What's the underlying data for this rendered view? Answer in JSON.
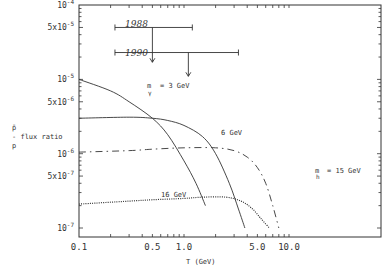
{
  "chart_data": {
    "type": "line",
    "title": "",
    "xlabel": "T (GeV)",
    "ylabel": "p̄ / p flux ratio",
    "xscale": "log",
    "yscale": "log",
    "xlim": [
      0.1,
      17
    ],
    "ylim": [
      1e-07,
      0.0001
    ],
    "grid": false,
    "x_ticks": [
      {
        "value": 0.1,
        "label": "0.1"
      },
      {
        "value": 0.5,
        "label": "0.5"
      },
      {
        "value": 1.0,
        "label": "1.0"
      },
      {
        "value": 5.0,
        "label": "5.0"
      },
      {
        "value": 10.0,
        "label": "10.0"
      }
    ],
    "y_ticks": [
      {
        "value": 0.0001,
        "base": "10",
        "exp": "-4"
      },
      {
        "value": 5e-05,
        "base": "5x10",
        "exp": "-5"
      },
      {
        "value": 1e-05,
        "base": "10",
        "exp": "-5"
      },
      {
        "value": 5e-06,
        "base": "5x10",
        "exp": "-6"
      },
      {
        "value": 1e-06,
        "base": "10",
        "exp": "-6"
      },
      {
        "value": 5e-07,
        "base": "5x10",
        "exp": "-7"
      },
      {
        "value": 1e-07,
        "base": "10",
        "exp": "-7"
      }
    ],
    "series": [
      {
        "name": "m_gamma~ = 3 GeV",
        "style": "solid",
        "x": [
          0.1,
          0.2,
          0.3,
          0.5,
          0.7,
          1.0,
          1.3,
          1.6
        ],
        "y": [
          1e-05,
          7e-06,
          5e-06,
          3e-06,
          1.8e-06,
          8e-07,
          4e-07,
          2e-07
        ]
      },
      {
        "name": "6 GeV",
        "style": "solid",
        "x": [
          0.1,
          0.3,
          0.5,
          0.7,
          1.0,
          1.5,
          2.0,
          2.7,
          3.3,
          3.8
        ],
        "y": [
          3e-06,
          3.1e-06,
          3e-06,
          2.8e-06,
          2.4e-06,
          1.7e-06,
          1e-06,
          4e-07,
          1.8e-07,
          1e-07
        ]
      },
      {
        "name": "m_h~ = 15 GeV",
        "style": "dash-dot",
        "x": [
          0.1,
          0.3,
          0.5,
          1.0,
          2.0,
          3.0,
          4.0,
          5.0,
          6.0,
          7.0,
          8.0
        ],
        "y": [
          1.05e-06,
          1.1e-06,
          1.15e-06,
          1.2e-06,
          1.2e-06,
          1.1e-06,
          9e-07,
          6.5e-07,
          4e-07,
          2e-07,
          1e-07
        ]
      },
      {
        "name": "16 GeV",
        "style": "dotted",
        "x": [
          0.1,
          0.3,
          0.5,
          1.0,
          1.5,
          2.5,
          3.5,
          4.5,
          5.5,
          6.5
        ],
        "y": [
          2.1e-07,
          2.3e-07,
          2.4e-07,
          2.5e-07,
          2.6e-07,
          2.6e-07,
          2.3e-07,
          1.8e-07,
          1.3e-07,
          1e-07
        ]
      }
    ],
    "annotations": [
      {
        "text": "1988",
        "type": "measurement-upper-limit",
        "x_range": [
          0.22,
          1.2
        ],
        "y": 5e-05,
        "arrow_x": 0.5,
        "arrow_to_y": 1.7e-05
      },
      {
        "text": "1990",
        "type": "measurement-upper-limit",
        "x_range": [
          0.22,
          3.3
        ],
        "y": 2.3e-05,
        "arrow_x": 1.1,
        "arrow_to_y": 1.1e-05
      },
      {
        "text": "m~ = 3 GeV",
        "subscript": "γ",
        "near_series": 0
      },
      {
        "text": "6 GeV",
        "near_series": 1
      },
      {
        "text": "m~ = 15 GeV",
        "subscript": "h",
        "near_series": 2
      },
      {
        "text": "16 GeV",
        "near_series": 3
      }
    ]
  },
  "labels": {
    "ylabel_top": "p̄",
    "ylabel_mid": "- flux ratio",
    "ylabel_bottom": "p",
    "xlabel": "T (GeV)",
    "ann_1988": "1988",
    "ann_1990": "1990",
    "ann_3gev_prefix": "m",
    "ann_3gev_sub": "γ",
    "ann_3gev_suffix": "= 3 GeV",
    "ann_6gev": "6 GeV",
    "ann_15gev_prefix": "m",
    "ann_15gev_sub": "h",
    "ann_15gev_suffix": "= 15 GeV",
    "ann_16gev": "16 GeV"
  }
}
